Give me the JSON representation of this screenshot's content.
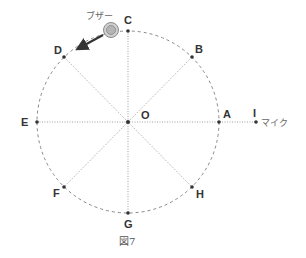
{
  "figure": {
    "caption": "図7",
    "center": {
      "label": "O",
      "x": 128,
      "y": 122
    },
    "radius": 91,
    "points": [
      {
        "id": "A",
        "label": "A",
        "x": 219,
        "y": 122,
        "lx": 223,
        "ly": 118
      },
      {
        "id": "B",
        "label": "B",
        "x": 192,
        "y": 57,
        "lx": 195,
        "ly": 53
      },
      {
        "id": "C",
        "label": "C",
        "x": 128,
        "y": 31,
        "lx": 123,
        "ly": 25
      },
      {
        "id": "D",
        "label": "D",
        "x": 64,
        "y": 57,
        "lx": 53,
        "ly": 53
      },
      {
        "id": "E",
        "label": "E",
        "x": 37,
        "y": 122,
        "lx": 22,
        "ly": 126
      },
      {
        "id": "F",
        "label": "F",
        "x": 64,
        "y": 187,
        "lx": 52,
        "ly": 197
      },
      {
        "id": "G",
        "label": "G",
        "x": 128,
        "y": 213,
        "lx": 123,
        "ly": 229
      },
      {
        "id": "H",
        "label": "H",
        "x": 192,
        "y": 187,
        "lx": 196,
        "ly": 197
      },
      {
        "id": "I",
        "label": "I",
        "x": 256,
        "y": 122,
        "lx": 253,
        "ly": 117
      }
    ],
    "buzzer": {
      "label": "ブザー",
      "x": 111,
      "y": 30,
      "r": 7
    },
    "microphone": {
      "label": "マイク"
    },
    "arrow": {
      "from": [
        103,
        36
      ],
      "to": [
        80,
        48
      ]
    },
    "colors": {
      "circle": "#888888",
      "lines": "#999999",
      "dots": "#333333",
      "buzzer_outer": "#999999",
      "buzzer_inner": "#bbbbbb",
      "arrow": "#333333"
    }
  }
}
